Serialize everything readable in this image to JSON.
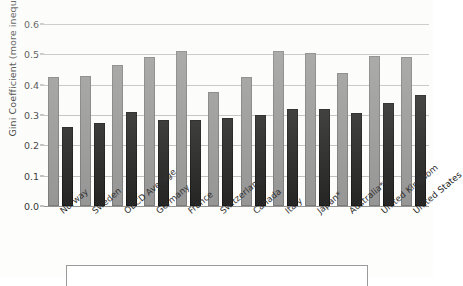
{
  "chart_data": {
    "type": "bar",
    "title": "",
    "xlabel": "",
    "ylabel": "Gini Coefficient (more inequality)",
    "ylim": [
      0.0,
      0.6
    ],
    "yticks": [
      "0.0",
      "0.1",
      "0.2",
      "0.3",
      "0.4",
      "0.5",
      "0.6"
    ],
    "ytick_values": [
      0.0,
      0.1,
      0.2,
      0.3,
      0.4,
      0.5,
      0.6
    ],
    "grid": true,
    "legend_position": "bottom",
    "categories": [
      "Norway",
      "Sweden",
      "OECD Average",
      "Germany",
      "France",
      "Switzerland",
      "Canada",
      "Italy",
      "Japan*",
      "Australia**",
      "United Kingdom",
      "United States"
    ],
    "series": [
      {
        "name": "gray-series",
        "color": "#8c8c8c",
        "values": [
          0.425,
          0.43,
          0.465,
          0.49,
          0.51,
          0.375,
          0.425,
          0.51,
          0.505,
          0.44,
          0.495,
          0.49
        ]
      },
      {
        "name": "black-series",
        "color": "#101010",
        "values": [
          0.26,
          0.275,
          0.31,
          0.285,
          0.285,
          0.29,
          0.3,
          0.32,
          0.32,
          0.305,
          0.34,
          0.365
        ]
      }
    ]
  },
  "legend": {
    "entries": []
  }
}
